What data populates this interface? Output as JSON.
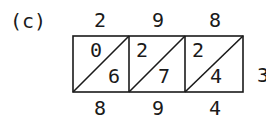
{
  "figure_label": "(c)",
  "lattice": {
    "multiplicand_digits": [
      "2",
      "9",
      "8"
    ],
    "multiplier_digits": [
      "3"
    ],
    "cells": [
      {
        "tens": "0",
        "ones": "6"
      },
      {
        "tens": "2",
        "ones": "7"
      },
      {
        "tens": "2",
        "ones": "4"
      }
    ],
    "result_digits": [
      "8",
      "9",
      "4"
    ]
  }
}
